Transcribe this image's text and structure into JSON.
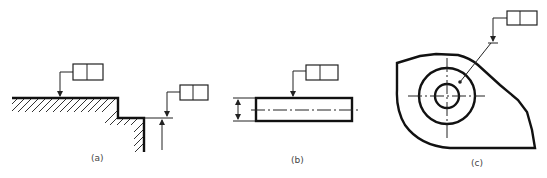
{
  "figure": {
    "panels": [
      {
        "id": "a",
        "caption": "(a)",
        "description": "Stepped surface with hatching, feature control frames applied to a surface and an extension line",
        "frames": [
          {
            "cells": [
              "",
              ""
            ]
          },
          {
            "cells": [
              "",
              ""
            ]
          }
        ]
      },
      {
        "id": "b",
        "caption": "(b)",
        "description": "Cylindrical part with centerline and diameter dimension; feature control frame leader to surface",
        "frames": [
          {
            "cells": [
              "",
              ""
            ]
          }
        ]
      },
      {
        "id": "c",
        "caption": "(c)",
        "description": "Plate with concentric circles and centerlines; feature control frame leader to circle",
        "frames": [
          {
            "cells": [
              "",
              ""
            ]
          }
        ]
      }
    ],
    "colors": {
      "line": "#111111",
      "background": "#ffffff"
    }
  }
}
